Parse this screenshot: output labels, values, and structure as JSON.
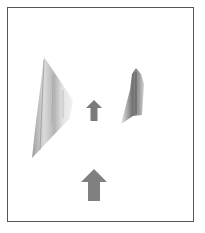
{
  "diagram": {
    "frame": {
      "border_color": "#555555"
    },
    "objects": [
      {
        "id": "left-shard",
        "kind": "textured-shape",
        "fill": "#c8c8c8",
        "shade": "#8a8a8a"
      },
      {
        "id": "right-shard",
        "kind": "textured-shape",
        "fill": "#a8a8a8",
        "shade": "#505050"
      },
      {
        "id": "small-arrow",
        "kind": "up-arrow",
        "color": "#7a7a7a"
      },
      {
        "id": "large-arrow",
        "kind": "up-arrow",
        "color": "#808080"
      }
    ]
  }
}
